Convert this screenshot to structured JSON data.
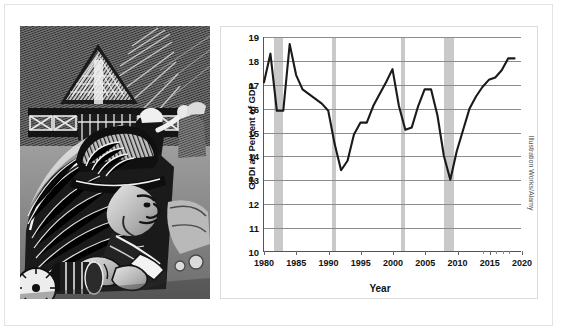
{
  "credit": "Illustration Works/Alamy",
  "illustration": {
    "alt": "Woodcut style illustration of industrial workers, a factory structure and a worker in a hard hat operating machinery"
  },
  "chart_data": {
    "type": "line",
    "title": "",
    "xlabel": "Year",
    "ylabel": "GPDI as Percent of GDP",
    "xlim": [
      1980,
      2020
    ],
    "ylim": [
      10,
      19
    ],
    "grid": true,
    "legend": false,
    "ytick_labels": [
      "19",
      "18",
      "17",
      "16",
      "15",
      "14",
      "13",
      "12",
      "11",
      "10"
    ],
    "ytick_values": [
      19,
      18,
      17,
      16,
      15,
      14,
      13,
      12,
      11,
      10
    ],
    "xtick_labels": [
      "1980",
      "1985",
      "1990",
      "1995",
      "2000",
      "2005",
      "2010",
      "2015",
      "2020"
    ],
    "xtick_values": [
      1980,
      1985,
      1990,
      1995,
      2000,
      2005,
      2010,
      2015,
      2020
    ],
    "series_name": "GPDI as Percent of GDP",
    "line_color": "#1a1a1a",
    "recession_color": "#c9c9c9",
    "recessions": [
      {
        "label": "1981-1982 recession",
        "start": 1981.5,
        "end": 1982.9
      },
      {
        "label": "1990-1991 recession",
        "start": 1990.5,
        "end": 1991.2
      },
      {
        "label": "2001 recession",
        "start": 2001.2,
        "end": 2001.9
      },
      {
        "label": "2007-2009 recession",
        "start": 2007.9,
        "end": 2009.5
      }
    ],
    "x": [
      1980,
      1981,
      1982,
      1983,
      1984,
      1985,
      1986,
      1987,
      1988,
      1989,
      1990,
      1991,
      1992,
      1993,
      1994,
      1995,
      1996,
      1997,
      1998,
      1999,
      2000,
      2001,
      2002,
      2003,
      2004,
      2005,
      2006,
      2007,
      2008,
      2009,
      2010,
      2011,
      2012,
      2013,
      2014,
      2015,
      2016,
      2017,
      2018,
      2019
    ],
    "values": [
      17.1,
      18.3,
      15.9,
      15.9,
      18.7,
      17.4,
      16.8,
      16.6,
      16.4,
      16.2,
      15.9,
      14.5,
      13.4,
      13.8,
      14.9,
      15.4,
      15.4,
      16.1,
      16.6,
      17.1,
      17.65,
      16.1,
      15.1,
      15.2,
      16.1,
      16.8,
      16.8,
      15.7,
      14.0,
      13.0,
      14.2,
      15.1,
      16.0,
      16.5,
      16.9,
      17.2,
      17.3,
      17.6,
      18.1,
      18.1
    ]
  }
}
